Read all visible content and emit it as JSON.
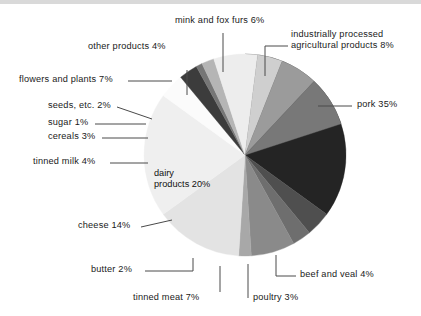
{
  "chart_data": {
    "type": "pie",
    "title": "",
    "subtitle": "",
    "xlabel": "",
    "ylabel": "",
    "legend_position": "none",
    "grid": false,
    "units": "percent",
    "total": 100,
    "start_angle_deg": 0,
    "direction": "clockwise",
    "center": {
      "x": 245,
      "y": 155
    },
    "radius": 101,
    "slices": [
      {
        "label": "pork",
        "value": 35,
        "value_text": "pork 35%",
        "color": "#242424",
        "label_position": "outside-right"
      },
      {
        "label": "beef and veal",
        "value": 4,
        "value_text": "beef and veal 4%",
        "color": "#4f4f4f",
        "label_position": "outside-bottom-right"
      },
      {
        "label": "poultry",
        "value": 3,
        "value_text": "poultry 3%",
        "color": "#6e6e6e",
        "label_position": "outside-bottom"
      },
      {
        "label": "tinned meat",
        "value": 7,
        "value_text": "tinned meat 7%",
        "color": "#8a8a8a",
        "label_position": "outside-bottom"
      },
      {
        "label": "butter",
        "value": 2,
        "value_text": "butter 2%",
        "color": "#a8a8a8",
        "label_position": "outside-bottom-left"
      },
      {
        "label": "cheese",
        "value": 14,
        "value_text": "cheese 14%",
        "color": "#e3e3e3",
        "label_position": "outside-left"
      },
      {
        "label": "dairy products",
        "value": 20,
        "value_text": "dairy products 20%",
        "color": "#efefef",
        "label_position": "inside"
      },
      {
        "label": "tinned milk",
        "value": 4,
        "value_text": "tinned milk 4%",
        "color": "#fbfbfb",
        "label_position": "outside-left"
      },
      {
        "label": "cereals",
        "value": 3,
        "value_text": "cereals 3%",
        "color": "#3c3c3c",
        "label_position": "outside-left"
      },
      {
        "label": "sugar",
        "value": 1,
        "value_text": "sugar 1%",
        "color": "#767676",
        "label_position": "outside-left"
      },
      {
        "label": "seeds, etc.",
        "value": 2,
        "value_text": "seeds, etc. 2%",
        "color": "#b5b5b5",
        "label_position": "outside-left"
      },
      {
        "label": "flowers and plants",
        "value": 7,
        "value_text": "flowers and plants 7%",
        "color": "#ededed",
        "label_position": "outside-left"
      },
      {
        "label": "other products",
        "value": 4,
        "value_text": "other products 4%",
        "color": "#cfcfcf",
        "label_position": "outside-top-left"
      },
      {
        "label": "mink and fox furs",
        "value": 6,
        "value_text": "mink and fox furs 6%",
        "color": "#9b9b9b",
        "label_position": "outside-top"
      },
      {
        "label": "industrially processed agricultural products",
        "value": 8,
        "value_text": "industrially processed agricultural products 8%",
        "color": "#787878",
        "label_position": "outside-top-right"
      }
    ]
  },
  "labels": {
    "mink_and_fox_furs": "mink and fox furs 6%",
    "industrially_processed_line1": "industrially processed",
    "industrially_processed_line2": "agricultural products 8%",
    "other_products": "other products 4%",
    "flowers_and_plants": "flowers and plants 7%",
    "seeds_etc": "seeds, etc. 2%",
    "sugar": "sugar 1%",
    "cereals": "cereals 3%",
    "tinned_milk": "tinned milk 4%",
    "pork": "pork 35%",
    "dairy_products_line1": "dairy",
    "dairy_products_line2": "products 20%",
    "cheese": "cheese 14%",
    "butter": "butter 2%",
    "tinned_meat": "tinned meat 7%",
    "poultry": "poultry 3%",
    "beef_and_veal": "beef and veal 4%"
  },
  "colors": {
    "background": "#ffffff",
    "text": "#1a1a1a",
    "leader_line": "#4a4a4a",
    "top_band": "#d9d9d9"
  }
}
